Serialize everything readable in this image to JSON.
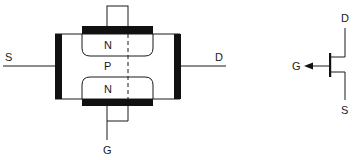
{
  "diagram": {
    "title": "",
    "cross_section": {
      "terminals": {
        "source": "S",
        "drain": "D",
        "gate": "G"
      },
      "regions": {
        "top_n": "N",
        "channel_p": "P",
        "bottom_n": "N"
      }
    },
    "symbol": {
      "terminals": {
        "drain": "D",
        "gate": "G",
        "source": "S"
      }
    },
    "colors": {
      "line": "#1a1a1a",
      "metal": "#111111",
      "background": "#ffffff"
    }
  }
}
